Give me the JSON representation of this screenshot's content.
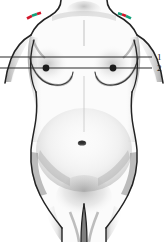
{
  "figure": {
    "type": "anatomical-illustration",
    "view": "anterior",
    "background_color": "#ffffff",
    "width": 168,
    "height": 242
  },
  "reference_lines": [
    {
      "id": "line-1",
      "label": "1",
      "y": 57,
      "x_start": 0,
      "x_end": 152,
      "color": "#2b2b2b",
      "description": "upper horizontal reference line"
    },
    {
      "id": "line-2",
      "label": "2",
      "y": 68,
      "x_start": 0,
      "x_end": 152,
      "color": "#2b2b2b",
      "description": "lower horizontal reference line through nipples"
    }
  ],
  "landmarks": {
    "nipples": [
      {
        "id": "nipple-left",
        "x": 46,
        "y": 68,
        "color": "#1c1c1c"
      },
      {
        "id": "nipple-right",
        "x": 113,
        "y": 68,
        "color": "#1c1c1c"
      }
    ],
    "navel": {
      "id": "navel",
      "x": 82,
      "y": 143,
      "color": "#4a4a4a"
    }
  },
  "shoulder_marks": [
    {
      "id": "shoulder-mark-left",
      "side": "left",
      "x": 34,
      "y": 15,
      "colors": [
        "#d2162a",
        "#13a07a",
        "#d2162a"
      ],
      "description": "colored annotation segment on left clavicle"
    },
    {
      "id": "shoulder-mark-right",
      "side": "right",
      "x": 123,
      "y": 15,
      "colors": [
        "#13a07a",
        "#d2162a",
        "#13a07a"
      ],
      "description": "colored annotation segment on right clavicle"
    }
  ],
  "palette": {
    "outline": "#232323",
    "shading_dark": "#6e6e6e",
    "shading_mid": "#a8a8a8",
    "shading_light": "#d8d8d8",
    "skin": "#fbfbfb",
    "line": "#2b2b2b",
    "label_text": "#1a1a1a",
    "accent_red": "#d2162a",
    "accent_green": "#13a07a"
  }
}
